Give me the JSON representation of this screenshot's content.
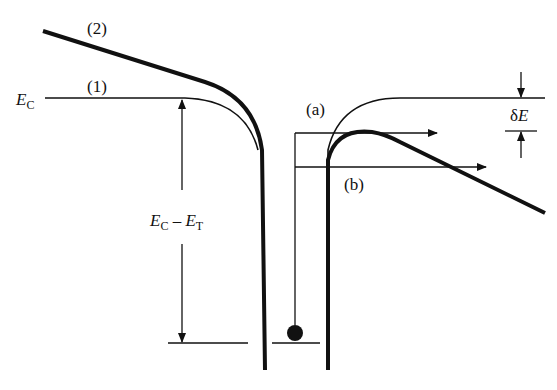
{
  "diagram": {
    "type": "energy-band-diagram",
    "labels": {
      "curve_2": "(2)",
      "curve_1": "(1)",
      "ec_main": "E",
      "ec_sub": "C",
      "gap_e1": "E",
      "gap_sub1": "C",
      "gap_minus": " – ",
      "gap_e2": "E",
      "gap_sub2": "T",
      "path_a": "(a)",
      "path_b": "(b)",
      "delta_e": "δ",
      "delta_e_var": "E"
    },
    "colors": {
      "line": "#111111",
      "background": "#ffffff"
    }
  }
}
